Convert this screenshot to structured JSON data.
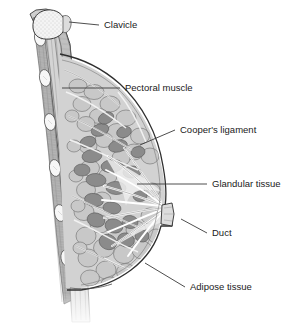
{
  "figure": {
    "type": "anatomical-diagram",
    "background_color": "#ffffff",
    "line_color": "#3a3a3a",
    "text_color": "#1a1a1a"
  },
  "labels": [
    {
      "id": "clavicle",
      "text": "Clavicle",
      "text_x": 104,
      "text_y": 25,
      "leader_points": "69,22 99,25",
      "structure_color": "#f2f2f2"
    },
    {
      "id": "pectoral-muscle",
      "text": "Pectoral muscle",
      "text_x": 125,
      "text_y": 88,
      "leader_points": "62,88 120,88",
      "structure_color": "#b0b0b0"
    },
    {
      "id": "coopers-ligament",
      "text": "Cooper's ligament",
      "text_x": 180,
      "text_y": 130,
      "leader_points": "140,145 175,130",
      "structure_color": "#ffffff"
    },
    {
      "id": "glandular-tissue",
      "text": "Glandular tissue",
      "text_x": 212,
      "text_y": 184,
      "leader_points": "137,184 207,184",
      "structure_color": "#8a8a8a"
    },
    {
      "id": "duct",
      "text": "Duct",
      "text_x": 212,
      "text_y": 233,
      "leader_points": "181,219 207,233",
      "structure_color": "#e8e8e8"
    },
    {
      "id": "adipose-tissue",
      "text": "Adipose tissue",
      "text_x": 190,
      "text_y": 287,
      "leader_points": "145,263 185,287",
      "structure_color": "#c5c5c5"
    }
  ],
  "colors": {
    "bone": "#f4f4f4",
    "bone_outline": "#4a4a4a",
    "muscle": "#b4b4b4",
    "muscle_dark": "#9a9a9a",
    "adipose": "#c8c8c8",
    "glandular": "#8c8c8c",
    "duct": "#efefef",
    "skin_line": "#2f2f2f",
    "subcutaneous": "#dedede",
    "rib": "#f6f6f6"
  }
}
